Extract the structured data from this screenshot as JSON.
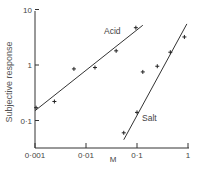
{
  "chart_data": {
    "type": "scatter",
    "title": "",
    "xlabel": "",
    "ylabel": "Subjective response",
    "xscale": "log",
    "yscale": "log",
    "xlim": [
      0.001,
      1
    ],
    "ylim": [
      0.05,
      10
    ],
    "grid": false,
    "legend": "inline labels",
    "x_ticks": [
      "0·001",
      "0·01",
      "0·1",
      "1"
    ],
    "y_ticks": [
      "0·1",
      "1",
      "10"
    ],
    "x_marker_label": "M",
    "series": [
      {
        "name": "Acid",
        "points": [
          {
            "x": 0.00105,
            "y": 0.17
          },
          {
            "x": 0.0024,
            "y": 0.22
          },
          {
            "x": 0.0058,
            "y": 0.85
          },
          {
            "x": 0.015,
            "y": 0.9
          },
          {
            "x": 0.039,
            "y": 1.8
          },
          {
            "x": 0.095,
            "y": 4.7
          }
        ],
        "fit_line": [
          {
            "x": 0.001,
            "y": 0.15
          },
          {
            "x": 0.13,
            "y": 5.2
          }
        ]
      },
      {
        "name": "Salt",
        "points": [
          {
            "x": 0.055,
            "y": 0.06
          },
          {
            "x": 0.1,
            "y": 0.14
          },
          {
            "x": 0.13,
            "y": 0.75
          },
          {
            "x": 0.25,
            "y": 0.95
          },
          {
            "x": 0.45,
            "y": 1.7
          },
          {
            "x": 0.85,
            "y": 3.2
          }
        ],
        "fit_line": [
          {
            "x": 0.055,
            "y": 0.045
          },
          {
            "x": 0.95,
            "y": 5.5
          }
        ]
      }
    ]
  }
}
